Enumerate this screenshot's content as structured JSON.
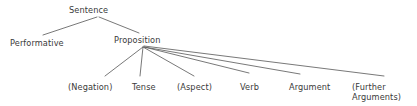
{
  "diagram": {
    "type": "tree",
    "background_color": "#ffffff",
    "line_color": "#555555",
    "text_color": "#3a3a3a",
    "nodes": {
      "root": {
        "label": "Sentence",
        "x": 69,
        "y": 5
      },
      "performative": {
        "label": "Performative",
        "x": 10,
        "y": 38
      },
      "proposition": {
        "label": "Proposition",
        "x": 114,
        "y": 35
      },
      "negation": {
        "label": "(Negation)",
        "x": 68,
        "y": 82
      },
      "tense": {
        "label": "Tense",
        "x": 132,
        "y": 82
      },
      "aspect": {
        "label": "(Aspect)",
        "x": 177,
        "y": 82
      },
      "verb": {
        "label": "Verb",
        "x": 240,
        "y": 82
      },
      "argument": {
        "label": "Argument",
        "x": 289,
        "y": 82
      },
      "further_arguments": {
        "label": "(Further\nArguments)",
        "x": 352,
        "y": 82
      }
    },
    "edges": [
      {
        "from": "root",
        "to": "performative",
        "x1": 97,
        "y1": 17,
        "x2": 43,
        "y2": 35
      },
      {
        "from": "root",
        "to": "proposition",
        "x1": 99,
        "y1": 17,
        "x2": 139,
        "y2": 33
      },
      {
        "from": "proposition",
        "to": "negation",
        "x1": 143,
        "y1": 47,
        "x2": 105,
        "y2": 76
      },
      {
        "from": "proposition",
        "to": "tense",
        "x1": 143,
        "y1": 47,
        "x2": 140,
        "y2": 76
      },
      {
        "from": "proposition",
        "to": "aspect",
        "x1": 143,
        "y1": 47,
        "x2": 194,
        "y2": 76
      },
      {
        "from": "proposition",
        "to": "verb",
        "x1": 144,
        "y1": 47,
        "x2": 249,
        "y2": 73
      },
      {
        "from": "proposition",
        "to": "argument",
        "x1": 144,
        "y1": 47,
        "x2": 300,
        "y2": 74
      },
      {
        "from": "proposition",
        "to": "further_arguments",
        "x1": 144,
        "y1": 46,
        "x2": 384,
        "y2": 76
      }
    ]
  }
}
